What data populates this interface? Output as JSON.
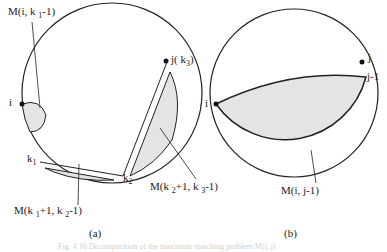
{
  "figure": {
    "panel_a": {
      "label": "(a)",
      "points": {
        "i": "i",
        "j": "j( k",
        "j_sub": "3",
        "j_close": ")",
        "k1": "k",
        "k1_sub": "1",
        "k2": "k",
        "k2_sub": "2"
      },
      "annotations": {
        "m1_a": "M(i, k ",
        "m1_sub": "1",
        "m1_b": "-1)",
        "m2_a": "M(k ",
        "m2_sub1": "1",
        "m2_b": "+1, k ",
        "m2_sub2": "2",
        "m2_c": "-1)",
        "m3_a": "M(k ",
        "m3_sub1": "2",
        "m3_b": "+1, k ",
        "m3_sub2": "3",
        "m3_c": "-1)"
      }
    },
    "panel_b": {
      "label": "(b)",
      "points": {
        "i": "i",
        "j": "j",
        "j_minus_1": "j-1"
      },
      "annotation": "M(i, j-1)"
    },
    "caption": "Fig. 4.16  Decomposition of the maximum matching problem M(i, j)"
  },
  "colors": {
    "stroke": "#222222",
    "fill": "#e4e4e4",
    "background": "#ffffff"
  }
}
